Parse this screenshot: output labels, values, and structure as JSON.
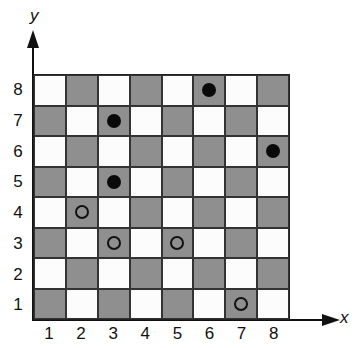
{
  "axes": {
    "x_label": "x",
    "y_label": "y",
    "x_ticks": [
      "1",
      "2",
      "3",
      "4",
      "5",
      "6",
      "7",
      "8"
    ],
    "y_ticks": [
      "8",
      "7",
      "6",
      "5",
      "4",
      "3",
      "2",
      "1"
    ]
  },
  "board": {
    "size": 8,
    "dark_color": "#8f8f8f",
    "light_color": "#fcfcfc",
    "pieces": [
      {
        "x": 6,
        "y": 8,
        "type": "filled"
      },
      {
        "x": 3,
        "y": 7,
        "type": "filled"
      },
      {
        "x": 8,
        "y": 6,
        "type": "filled"
      },
      {
        "x": 3,
        "y": 5,
        "type": "filled"
      },
      {
        "x": 2,
        "y": 4,
        "type": "hollow"
      },
      {
        "x": 3,
        "y": 3,
        "type": "hollow"
      },
      {
        "x": 5,
        "y": 3,
        "type": "hollow"
      },
      {
        "x": 7,
        "y": 1,
        "type": "hollow"
      }
    ]
  }
}
